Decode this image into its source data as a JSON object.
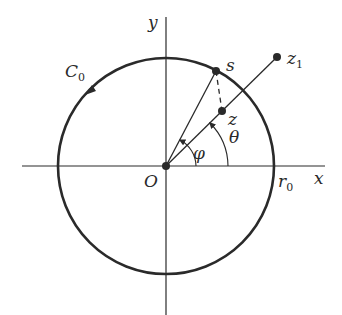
{
  "diagram": {
    "colors": {
      "stroke": "#2a2a2a",
      "background": "#ffffff"
    },
    "labels": {
      "y_axis": "y",
      "x_axis": "x",
      "origin": "O",
      "contour": "C",
      "contour_sub": "0",
      "radius": "r",
      "radius_sub": "0",
      "point_s": "s",
      "point_z": "z",
      "point_z1": "z",
      "point_z1_sub": "1",
      "angle_phi": "φ",
      "angle_theta": "θ"
    },
    "elements": [
      {
        "id": "x-axis",
        "type": "line"
      },
      {
        "id": "y-axis",
        "type": "line"
      },
      {
        "id": "circle-C0",
        "type": "circle",
        "orientation": "counterclockwise"
      },
      {
        "id": "ray-O-z1",
        "type": "line"
      },
      {
        "id": "segment-O-s",
        "type": "line"
      },
      {
        "id": "dashed-s-z",
        "type": "dashed-line"
      },
      {
        "id": "arc-phi",
        "type": "angle-arc"
      },
      {
        "id": "arc-theta",
        "type": "angle-arc"
      }
    ]
  }
}
